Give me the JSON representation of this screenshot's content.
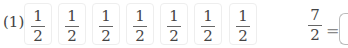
{
  "problem": {
    "label": "(1)",
    "pieces": [
      {
        "numerator": "1",
        "denominator": "2"
      },
      {
        "numerator": "1",
        "denominator": "2"
      },
      {
        "numerator": "1",
        "denominator": "2"
      },
      {
        "numerator": "1",
        "denominator": "2"
      },
      {
        "numerator": "1",
        "denominator": "2"
      },
      {
        "numerator": "1",
        "denominator": "2"
      },
      {
        "numerator": "1",
        "denominator": "2"
      }
    ],
    "equation": {
      "numerator": "7",
      "denominator": "2",
      "equals": "=",
      "answer": ""
    }
  }
}
